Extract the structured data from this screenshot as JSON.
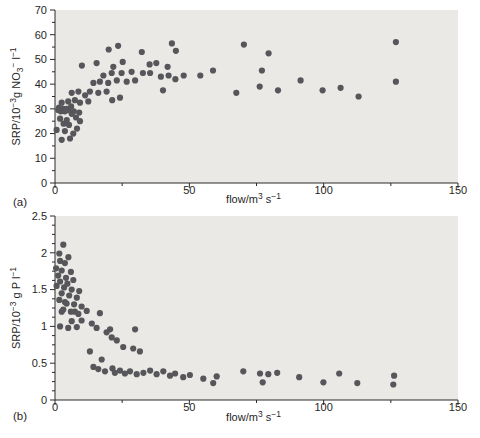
{
  "colors": {
    "dot": "#57575b",
    "plot_bg": "#eae9e5",
    "axis": "#2a2a2a",
    "text": "#1f1f1f"
  },
  "chart_data": [
    {
      "type": "scatter",
      "panel_label": "(a)",
      "xlabel_rich": [
        [
          "flow/m",
          "n"
        ],
        [
          "3",
          "sup"
        ],
        [
          " s",
          "n"
        ],
        [
          "−1",
          "sup"
        ]
      ],
      "ylabel_rich": [
        [
          "SRP/10",
          "n"
        ],
        [
          "−3",
          "sup"
        ],
        [
          "g NO",
          "n"
        ],
        [
          "3",
          "sub"
        ],
        [
          "−",
          "sup"
        ],
        [
          " l",
          "n"
        ],
        [
          "−1",
          "sup"
        ]
      ],
      "xlim": [
        0,
        150
      ],
      "ylim": [
        0,
        70
      ],
      "xticks": [
        0,
        50,
        100,
        150
      ],
      "xtick_labels": [
        "0",
        "50",
        "100",
        "150"
      ],
      "yticks": [
        0,
        10,
        20,
        30,
        40,
        50,
        60,
        70
      ],
      "ytick_labels": [
        "0",
        "10",
        "20",
        "30",
        "40",
        "50",
        "60",
        "70"
      ],
      "x_minor_step": 25,
      "y_minor_step": 5,
      "grid": false,
      "legend": null,
      "points": [
        [
          0.6,
          21.5
        ],
        [
          1.2,
          29.5
        ],
        [
          1.5,
          30.5
        ],
        [
          1.9,
          26
        ],
        [
          2.2,
          29
        ],
        [
          2.5,
          32.5
        ],
        [
          2.5,
          17.5
        ],
        [
          3,
          30
        ],
        [
          3.2,
          24
        ],
        [
          3.7,
          29
        ],
        [
          3.7,
          21
        ],
        [
          4.2,
          30
        ],
        [
          4.4,
          25.5
        ],
        [
          4.9,
          33
        ],
        [
          5,
          29.5
        ],
        [
          5.2,
          23.5
        ],
        [
          5.6,
          18
        ],
        [
          6,
          31
        ],
        [
          6.2,
          36.5
        ],
        [
          6.2,
          28
        ],
        [
          6.8,
          20
        ],
        [
          7,
          29
        ],
        [
          7.4,
          33.5
        ],
        [
          7.8,
          26.5
        ],
        [
          8.2,
          22
        ],
        [
          8.7,
          37
        ],
        [
          9,
          28.5
        ],
        [
          9.3,
          32.5
        ],
        [
          9.3,
          25
        ],
        [
          10,
          47.5
        ],
        [
          11.2,
          35.5
        ],
        [
          12.4,
          33
        ],
        [
          13,
          37
        ],
        [
          14.3,
          40.5
        ],
        [
          15.5,
          48.5
        ],
        [
          16.1,
          36.5
        ],
        [
          16.7,
          41
        ],
        [
          18,
          43.5
        ],
        [
          19.2,
          37
        ],
        [
          19.8,
          40.5
        ],
        [
          20,
          54
        ],
        [
          21.1,
          44.5
        ],
        [
          21.3,
          33.5
        ],
        [
          21.7,
          47
        ],
        [
          23,
          41.5
        ],
        [
          23.5,
          55.5
        ],
        [
          24.2,
          34.5
        ],
        [
          24.8,
          44.5
        ],
        [
          25.2,
          49
        ],
        [
          26.7,
          41
        ],
        [
          28.5,
          45
        ],
        [
          29.8,
          41.5
        ],
        [
          32.3,
          53
        ],
        [
          32.7,
          44.5
        ],
        [
          35.2,
          48
        ],
        [
          35.4,
          44.5
        ],
        [
          37.7,
          48.5
        ],
        [
          39.4,
          43
        ],
        [
          40.2,
          37.5
        ],
        [
          41.9,
          47
        ],
        [
          42.3,
          43.5
        ],
        [
          43.5,
          56.5
        ],
        [
          44.8,
          42
        ],
        [
          45,
          53.5
        ],
        [
          47.9,
          43.5
        ],
        [
          54.1,
          43.5
        ],
        [
          58.8,
          45.5
        ],
        [
          67.5,
          36.5
        ],
        [
          70.3,
          56
        ],
        [
          76.2,
          39
        ],
        [
          77,
          45.5
        ],
        [
          79.5,
          52.5
        ],
        [
          83,
          37.5
        ],
        [
          91.4,
          41.5
        ],
        [
          99.6,
          37.5
        ],
        [
          106.3,
          38.5
        ],
        [
          113,
          35
        ],
        [
          126.9,
          57
        ],
        [
          126.9,
          41
        ]
      ]
    },
    {
      "type": "scatter",
      "panel_label": "(b)",
      "xlabel_rich": [
        [
          "flow/m",
          "n"
        ],
        [
          "3",
          "sup"
        ],
        [
          " s",
          "n"
        ],
        [
          "−1",
          "sup"
        ]
      ],
      "ylabel_rich": [
        [
          "SRP/10",
          "n"
        ],
        [
          "−3",
          "sup"
        ],
        [
          " g P l",
          "n"
        ],
        [
          "−1",
          "sup"
        ]
      ],
      "xlim": [
        0,
        150
      ],
      "ylim": [
        0,
        2.5
      ],
      "xticks": [
        0,
        50,
        100,
        150
      ],
      "xtick_labels": [
        "0",
        "50",
        "100",
        "150"
      ],
      "yticks": [
        0,
        0.5,
        1,
        1.5,
        2,
        2.5
      ],
      "ytick_labels": [
        "0",
        "0.5",
        "1",
        "1.5",
        "2",
        "2.5"
      ],
      "x_minor_step": 25,
      "y_minor_step": 0.125,
      "grid": false,
      "legend": null,
      "points": [
        [
          0.4,
          1.79
        ],
        [
          0.6,
          1.55
        ],
        [
          1.2,
          1.69
        ],
        [
          1.6,
          1.99
        ],
        [
          1.6,
          1.36
        ],
        [
          1.9,
          1.89
        ],
        [
          1.9,
          1.61
        ],
        [
          1.9,
          1.0
        ],
        [
          2.5,
          1.76
        ],
        [
          2.5,
          1.45
        ],
        [
          2.5,
          1.2
        ],
        [
          3.1,
          2.11
        ],
        [
          3.1,
          1.23
        ],
        [
          3.4,
          1.53
        ],
        [
          3.7,
          1.86
        ],
        [
          3.7,
          1.33
        ],
        [
          4.1,
          1.66
        ],
        [
          4.3,
          1.31
        ],
        [
          4.6,
          1.58
        ],
        [
          4.9,
          0.98
        ],
        [
          5,
          1.94
        ],
        [
          5.3,
          1.42
        ],
        [
          5.9,
          1.74
        ],
        [
          5.9,
          1.2
        ],
        [
          6.2,
          1.5
        ],
        [
          6.2,
          1.07
        ],
        [
          6.8,
          1.63
        ],
        [
          7.1,
          1.3
        ],
        [
          7.4,
          1.2
        ],
        [
          8.1,
          1.39
        ],
        [
          8.1,
          0.99
        ],
        [
          8.7,
          1.17
        ],
        [
          9,
          1.48
        ],
        [
          9.9,
          1.27
        ],
        [
          9.9,
          1.08
        ],
        [
          11.8,
          1.21
        ],
        [
          13,
          0.66
        ],
        [
          13.7,
          1.04
        ],
        [
          14.3,
          0.45
        ],
        [
          15.5,
          0.98
        ],
        [
          16.1,
          0.42
        ],
        [
          16.7,
          1.18
        ],
        [
          17.4,
          0.55
        ],
        [
          18.6,
          0.39
        ],
        [
          19.2,
          0.92
        ],
        [
          20.5,
          0.96
        ],
        [
          21.1,
          0.85
        ],
        [
          21.4,
          0.43
        ],
        [
          22.3,
          0.37
        ],
        [
          23,
          0.81
        ],
        [
          24.2,
          0.4
        ],
        [
          25.4,
          0.72
        ],
        [
          26,
          0.36
        ],
        [
          27.9,
          0.39
        ],
        [
          29.1,
          0.7
        ],
        [
          29.8,
          0.96
        ],
        [
          30.4,
          0.35
        ],
        [
          31.6,
          0.66
        ],
        [
          32.9,
          0.37
        ],
        [
          35.4,
          0.4
        ],
        [
          37.8,
          0.35
        ],
        [
          40.3,
          0.39
        ],
        [
          42.8,
          0.33
        ],
        [
          44.7,
          0.36
        ],
        [
          47.7,
          0.31
        ],
        [
          50.2,
          0.34
        ],
        [
          55.2,
          0.29
        ],
        [
          58.9,
          0.23
        ],
        [
          60.2,
          0.32
        ],
        [
          70.1,
          0.39
        ],
        [
          76.3,
          0.36
        ],
        [
          77.3,
          0.24
        ],
        [
          79.4,
          0.35
        ],
        [
          82.7,
          0.37
        ],
        [
          90.9,
          0.31
        ],
        [
          99.9,
          0.24
        ],
        [
          105.8,
          0.36
        ],
        [
          112.5,
          0.23
        ],
        [
          126.2,
          0.33
        ],
        [
          125.9,
          0.21
        ]
      ]
    }
  ]
}
